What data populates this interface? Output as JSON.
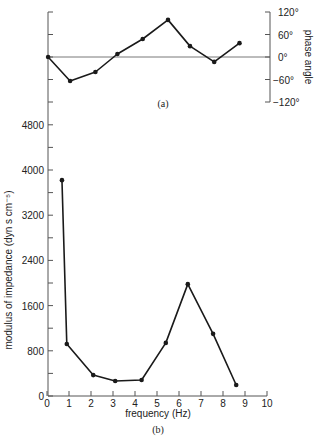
{
  "chart_data": [
    {
      "panel": "(a)",
      "type": "line",
      "title": "",
      "xlabel": "",
      "ylabel": "phase angle",
      "ylabel_position": "right",
      "ylim": [
        -120,
        120
      ],
      "yticks": [
        "120°",
        "60°",
        "0°",
        "−60°",
        "−120°"
      ],
      "yticks_values": [
        120,
        60,
        0,
        -60,
        -120
      ],
      "zero_line": true,
      "grid": false,
      "x": [
        0.05,
        1.05,
        2.2,
        3.2,
        4.35,
        5.5,
        6.5,
        7.6,
        8.75
      ],
      "values": [
        0,
        -64,
        -40,
        8,
        48,
        99,
        29,
        -13,
        37
      ]
    },
    {
      "panel": "(b)",
      "type": "line",
      "title": "",
      "xlabel": "frequency (Hz)",
      "ylabel": "modulus of impedance (dyn s cm⁻⁵)",
      "xlim": [
        0,
        10
      ],
      "ylim": [
        0,
        5200
      ],
      "xticks": [
        "0",
        "1",
        "2",
        "3",
        "4",
        "5",
        "6",
        "7",
        "8",
        "9",
        "10"
      ],
      "yticks": [
        "0",
        "800",
        "1600",
        "2400",
        "3200",
        "4000",
        "4800"
      ],
      "yticks_values": [
        0,
        800,
        1600,
        2400,
        3200,
        4000,
        4800
      ],
      "minor_ytick_step": 400,
      "grid": false,
      "x": [
        0.68,
        0.9,
        2.1,
        3.1,
        4.3,
        5.4,
        6.4,
        7.55,
        8.6
      ],
      "values": [
        3820,
        920,
        370,
        265,
        283,
        940,
        1980,
        1100,
        195
      ]
    }
  ],
  "labels": {
    "panel_a": "(a)",
    "panel_b": "(b)",
    "phase_axis_title": "phase angle",
    "impedance_axis_title": "modulus of impedance (dyn s cm⁻⁵)",
    "frequency_axis_title": "frequency (Hz)"
  },
  "colors": {
    "line": "#1a1a1a",
    "axis": "#555555",
    "text": "#222222"
  }
}
